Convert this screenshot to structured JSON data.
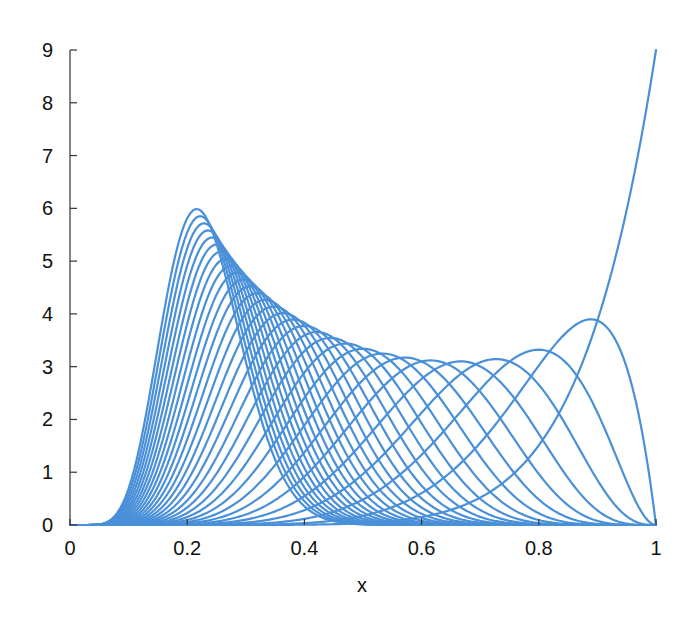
{
  "chart_data": {
    "type": "line",
    "title": "",
    "xlabel": "x",
    "ylabel": "",
    "xlim": [
      0,
      1
    ],
    "ylim": [
      0,
      9
    ],
    "grid": false,
    "legend": null,
    "x_ticks": [
      0,
      0.2,
      0.4,
      0.6,
      0.8,
      1
    ],
    "x_tick_labels": [
      "0",
      "0.2",
      "0.4",
      "0.6",
      "0.8",
      "1"
    ],
    "y_ticks": [
      0,
      1,
      2,
      3,
      4,
      5,
      6,
      7,
      8,
      9
    ],
    "y_tick_labels": [
      "0",
      "1",
      "2",
      "3",
      "4",
      "5",
      "6",
      "7",
      "8",
      "9"
    ],
    "line_color": "#4a90d9",
    "family": {
      "distribution": "beta",
      "alpha": 9,
      "beta_values": [
        1,
        2,
        3,
        4,
        5,
        6,
        7,
        8,
        9,
        10,
        11,
        12,
        13,
        14,
        15,
        16,
        17,
        18,
        19,
        20,
        21,
        22,
        23,
        24,
        25,
        26,
        27,
        28,
        29,
        30
      ],
      "samples": 200
    },
    "annotated_peaks": [
      {
        "series": "Beta(9,1)",
        "x": 1.0,
        "y": 9.0
      },
      {
        "series": "Beta(9,2)",
        "x": 0.889,
        "y": 3.87
      },
      {
        "series": "Beta(9,3)",
        "x": 0.8,
        "y": 3.32
      },
      {
        "series": "Beta(9,4)",
        "x": 0.727,
        "y": 3.13
      },
      {
        "series": "Beta(9,5)",
        "x": 0.667,
        "y": 3.08
      },
      {
        "series": "Beta(9,30)",
        "x": 0.22,
        "y": 5.85
      }
    ]
  }
}
